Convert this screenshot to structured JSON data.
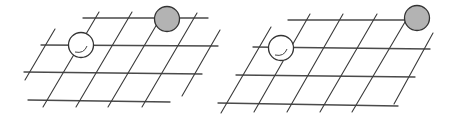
{
  "figure": {
    "panels": [
      {
        "name": "left-board",
        "grid": {
          "rows": 4,
          "columns": 6
        },
        "stones": [
          {
            "color": "white",
            "row": 2,
            "col": 2
          },
          {
            "color": "gray",
            "row": 1,
            "col": 5
          }
        ]
      },
      {
        "name": "right-board",
        "grid": {
          "rows": 4,
          "columns": 6
        },
        "stones": [
          {
            "color": "white",
            "row": 2,
            "col": 2
          },
          {
            "color": "gray",
            "row": 1,
            "col": 6
          }
        ]
      }
    ],
    "colors": {
      "line": "#3a3a3a",
      "white_stone": "#ffffff",
      "gray_stone": "#b3b3b3",
      "stone_outline": "#333333"
    }
  }
}
